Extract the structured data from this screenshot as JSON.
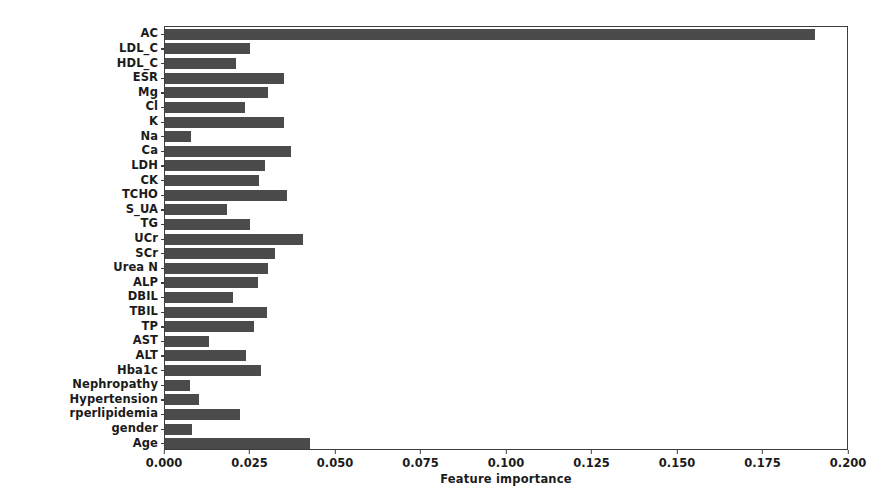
{
  "chart": {
    "xlabel": "Feature importance",
    "ylabel": "",
    "title": ""
  },
  "colors": {
    "bar": "#4b4b4b",
    "axis": "#3d3d3d",
    "text": "#1b1b1b",
    "background": "#ffffff"
  },
  "chart_data": {
    "type": "bar",
    "orientation": "horizontal",
    "title": "",
    "xlabel": "Feature importance",
    "ylabel": "",
    "xlim": [
      0.0,
      0.2
    ],
    "ylim": null,
    "grid": false,
    "legend": null,
    "xticks": [
      "0.000",
      "0.025",
      "0.050",
      "0.075",
      "0.100",
      "0.125",
      "0.150",
      "0.175",
      "0.200"
    ],
    "xtick_values": [
      0.0,
      0.025,
      0.05,
      0.075,
      0.1,
      0.125,
      0.15,
      0.175,
      0.2
    ],
    "categories": [
      "AC",
      "LDL_C",
      "HDL_C",
      "ESR",
      "Mg",
      "Cl",
      "K",
      "Na",
      "Ca",
      "LDH",
      "CK",
      "TCHO",
      "S_UA",
      "TG",
      "UCr",
      "SCr",
      "Urea N",
      "ALP",
      "DBIL",
      "TBIL",
      "TP",
      "AST",
      "ALT",
      "Hba1c",
      "Nephropathy",
      "Hypertension",
      "rperlipidemia",
      "gender",
      "Age"
    ],
    "values": [
      0.19,
      0.0249,
      0.0208,
      0.0348,
      0.03,
      0.0234,
      0.0348,
      0.0076,
      0.0368,
      0.0292,
      0.0275,
      0.0357,
      0.0181,
      0.0249,
      0.0403,
      0.0322,
      0.0301,
      0.0272,
      0.0199,
      0.0298,
      0.026,
      0.0129,
      0.0237,
      0.0281,
      0.0073,
      0.0099,
      0.0219,
      0.0079,
      0.0424
    ]
  }
}
